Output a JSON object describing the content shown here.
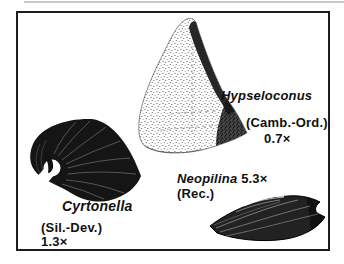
{
  "figure": {
    "background_color": "#ffffff",
    "ink_color": "#1a1a1a",
    "specimens": [
      {
        "id": "hypseloconus",
        "name": "Hypseloconus",
        "age": "(Camb.-Ord.)",
        "magnification": "0.7×",
        "shape": "tall stippled cone"
      },
      {
        "id": "cyrtonella",
        "name": "Cyrtonella",
        "age": "(Sil.-Dev.)",
        "magnification": "1.3×",
        "shape": "dark curled cap shell with hooked beak"
      },
      {
        "id": "neopilina",
        "name": "Neopilina",
        "age": "(Rec.)",
        "magnification": "5.3×",
        "shape": "low limpet-like cap shell with notched posterior"
      }
    ]
  }
}
